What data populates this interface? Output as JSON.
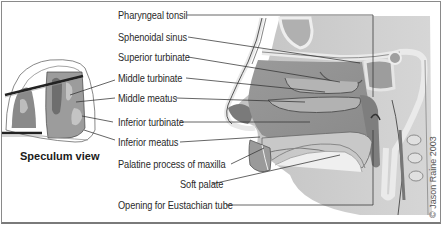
{
  "diagram": {
    "labels": [
      {
        "id": "pharyngeal-tonsil",
        "text": "Pharyngeal tonsil"
      },
      {
        "id": "sphenoidal-sinus",
        "text": "Sphenoidal sinus"
      },
      {
        "id": "superior-turbinate",
        "text": "Superior turbinate"
      },
      {
        "id": "middle-turbinate",
        "text": "Middle turbinate"
      },
      {
        "id": "middle-meatus",
        "text": "Middle meatus"
      },
      {
        "id": "inferior-turbinate",
        "text": "Inferior turbinate"
      },
      {
        "id": "inferior-meatus",
        "text": "Inferior meatus"
      },
      {
        "id": "palatine-process",
        "text": "Palatine process of maxilla"
      },
      {
        "id": "soft-palate",
        "text": "Soft palate"
      },
      {
        "id": "eustachian-opening",
        "text": "Opening for Eustachian tube"
      }
    ],
    "inset_caption": "Speculum view",
    "copyright": "© Jason Raine 2003",
    "colors": {
      "tissue_dark": "#8c8c8c",
      "tissue_mid": "#a8a8a8",
      "tissue_light": "#d4d4d4",
      "bone": "#ececec",
      "line": "#333333",
      "frame": "#8a8a8a"
    }
  }
}
